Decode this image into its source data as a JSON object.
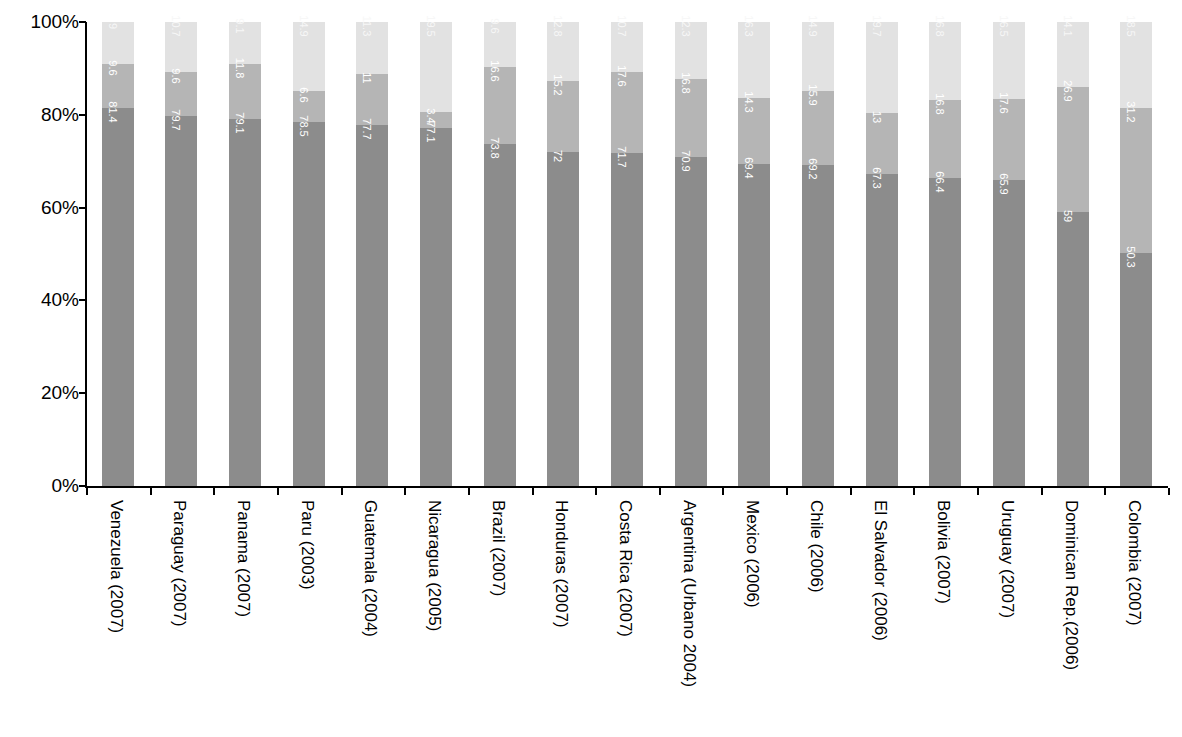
{
  "chart_data": {
    "type": "bar",
    "subtype": "stacked-bar-100-percent",
    "title": "",
    "subtitle": "",
    "xlabel": "",
    "ylabel": "",
    "ylim": [
      0,
      100
    ],
    "ytick_labels": [
      "100%",
      "80%",
      "60%",
      "40%",
      "20%",
      "0%"
    ],
    "ytick_values": [
      100,
      80,
      60,
      40,
      20,
      0
    ],
    "grid": false,
    "legend": false,
    "legend_position": "none",
    "orientation": "vertical",
    "value_labels_rotated": true,
    "categories": [
      "Venezuela (2007)",
      "Paraguay (2007)",
      "Panama (2007)",
      "Paru (2003)",
      "Guatemala (2004)",
      "Nicaragua (2005)",
      "Brazil (2007)",
      "Honduras (2007)",
      "Costa Rica (2007)",
      "Argentina (Urbano 2004)",
      "Mexico (2006)",
      "Chile (2006)",
      "El Salvador (2006)",
      "Bolivia (2007)",
      "Uruguay (2007)",
      "Dominican Rep.(2006)",
      "Colombia (2007)"
    ],
    "series": [
      {
        "name": "segment-1",
        "color": "#8c8c8c",
        "values": [
          81.4,
          79.7,
          79.1,
          78.5,
          77.7,
          77.1,
          73.8,
          72,
          71.7,
          70.9,
          69.4,
          69.2,
          67.3,
          66.4,
          65.9,
          59,
          50.3
        ],
        "labels": [
          "81.4",
          "79.7",
          "79.1",
          "78.5",
          "77.7",
          "77.1",
          "73.8",
          "72",
          "71.7",
          "70.9",
          "69.4",
          "69.2",
          "67.3",
          "66.4",
          "65.9",
          "59",
          "50.3"
        ]
      },
      {
        "name": "segment-2",
        "color": "#b5b5b5",
        "values": [
          9.6,
          9.6,
          11.8,
          6.6,
          11,
          3.4,
          16.6,
          15.2,
          17.6,
          16.8,
          14.3,
          15.9,
          13,
          16.8,
          17.6,
          26.9,
          31.2
        ],
        "labels": [
          "9.6",
          "9.6",
          "11.8",
          "6.6",
          "11",
          "3.4",
          "16.6",
          "15.2",
          "17.6",
          "16.8",
          "14.3",
          "15.9",
          "13",
          "16.8",
          "17.6",
          "26.9",
          "31.2"
        ]
      },
      {
        "name": "segment-3",
        "color": "#e2e2e2",
        "values": [
          9,
          10.7,
          9.1,
          14.9,
          11.3,
          19.5,
          9.6,
          12.8,
          10.7,
          12.3,
          16.3,
          14.9,
          19.7,
          16.8,
          16.5,
          14.1,
          18.5
        ],
        "labels": [
          "9",
          "10.7",
          "9.1",
          "14.9",
          "11.3",
          "19.5",
          "9.6",
          "12.8",
          "10.7",
          "12.3",
          "16.3",
          "14.9",
          "19.7",
          "16.8",
          "16.5",
          "14.1",
          "18.5"
        ]
      }
    ]
  }
}
